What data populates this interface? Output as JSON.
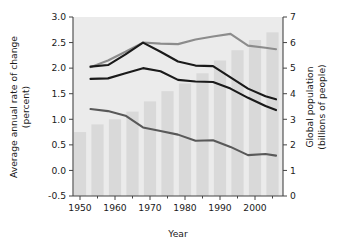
{
  "chart_data": {
    "type": "bar",
    "title": "",
    "subtitle": "",
    "xlabel": "Year",
    "ylabel": "Average annual rate of change (percent)",
    "ylabel_line1": "Average annual rate of change",
    "ylabel_line2": "(percent)",
    "y2label": "Global population (billions of people)",
    "y2label_line1": "Global population",
    "y2label_line2": "(billions of people)",
    "grid": false,
    "legend": "none",
    "xlim": [
      1948,
      2008
    ],
    "ylim": [
      -0.5,
      3.0
    ],
    "y2lim": [
      0,
      7
    ],
    "x_tick_labels": [
      "1950",
      "1960",
      "1970",
      "1980",
      "1990",
      "2000"
    ],
    "x_tick_values": [
      1950,
      1960,
      1970,
      1980,
      1990,
      2000
    ],
    "x_minor_ticks": [
      1955,
      1965,
      1975,
      1985,
      1995,
      2005
    ],
    "y_tick_labels": [
      "3.0",
      "2.5",
      "2.0",
      "1.5",
      "1.0",
      "0.5",
      "0.0",
      "-0.5"
    ],
    "y_tick_values": [
      3.0,
      2.5,
      2.0,
      1.5,
      1.0,
      0.5,
      0.0,
      -0.5
    ],
    "y2_tick_labels": [
      "7",
      "6",
      "5",
      "4",
      "3",
      "2",
      "1",
      "0"
    ],
    "y2_tick_values": [
      7,
      6,
      5,
      4,
      3,
      2,
      1,
      0
    ],
    "bars": {
      "name": "Global population",
      "axis": "right",
      "color": "#d9d9d9",
      "unit": "billions of people",
      "x": [
        1950,
        1955,
        1960,
        1965,
        1970,
        1975,
        1980,
        1985,
        1990,
        1995,
        2000,
        2005
      ],
      "values": [
        2.5,
        2.8,
        3.0,
        3.3,
        3.7,
        4.1,
        4.4,
        4.8,
        5.3,
        5.7,
        6.1,
        6.4
      ]
    },
    "series": [
      {
        "name": "Upper rate curve",
        "axis": "left",
        "color": "#8c8c8c",
        "type": "line",
        "x": [
          1953,
          1958,
          1963,
          1968,
          1973,
          1978,
          1983,
          1988,
          1993,
          1998,
          2003,
          2006
        ],
        "values": [
          2.02,
          2.15,
          2.32,
          2.5,
          2.48,
          2.47,
          2.56,
          2.62,
          2.67,
          2.44,
          2.4,
          2.37
        ]
      },
      {
        "name": "Middle rate curve",
        "axis": "left",
        "color": "#1a1a1a",
        "type": "line",
        "x": [
          1953,
          1958,
          1963,
          1968,
          1973,
          1978,
          1983,
          1988,
          1993,
          1998,
          2003,
          2006
        ],
        "values": [
          2.03,
          2.06,
          2.27,
          2.5,
          2.32,
          2.13,
          2.05,
          2.04,
          1.82,
          1.6,
          1.45,
          1.39
        ]
      },
      {
        "name": "Lower-middle rate curve",
        "axis": "left",
        "color": "#1a1a1a",
        "type": "line",
        "x": [
          1953,
          1958,
          1963,
          1968,
          1973,
          1978,
          1983,
          1988,
          1993,
          1998,
          2003,
          2006
        ],
        "values": [
          1.79,
          1.8,
          1.9,
          2.0,
          1.94,
          1.77,
          1.74,
          1.73,
          1.6,
          1.42,
          1.26,
          1.18
        ]
      },
      {
        "name": "Bottom rate curve",
        "axis": "left",
        "color": "#595959",
        "type": "line",
        "x": [
          1953,
          1958,
          1963,
          1968,
          1973,
          1978,
          1983,
          1988,
          1993,
          1998,
          2003,
          2006
        ],
        "values": [
          1.2,
          1.16,
          1.07,
          0.84,
          0.77,
          0.7,
          0.58,
          0.59,
          0.46,
          0.3,
          0.32,
          0.29
        ]
      }
    ]
  },
  "figure": {
    "background_color": "#ffffff",
    "plot_background_color": "#ebebeb",
    "axis_color": "#444444"
  }
}
